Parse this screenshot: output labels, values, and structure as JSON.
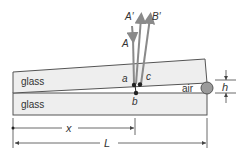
{
  "diagram": {
    "labels": {
      "glass_top": "glass",
      "glass_bottom": "glass",
      "air": "air",
      "ray_incident": "A",
      "ray_reflected_1": "A′",
      "ray_reflected_2": "B′",
      "point_a": "a",
      "point_b": "b",
      "point_c": "c",
      "thickness": "h",
      "distance_x": "x",
      "length_L": "L"
    },
    "colors": {
      "glass_fill": "#eeeeee",
      "outline": "#555555",
      "ray": "#8a8a8a",
      "spacer": "#9a9a9a",
      "text": "#333333"
    }
  }
}
